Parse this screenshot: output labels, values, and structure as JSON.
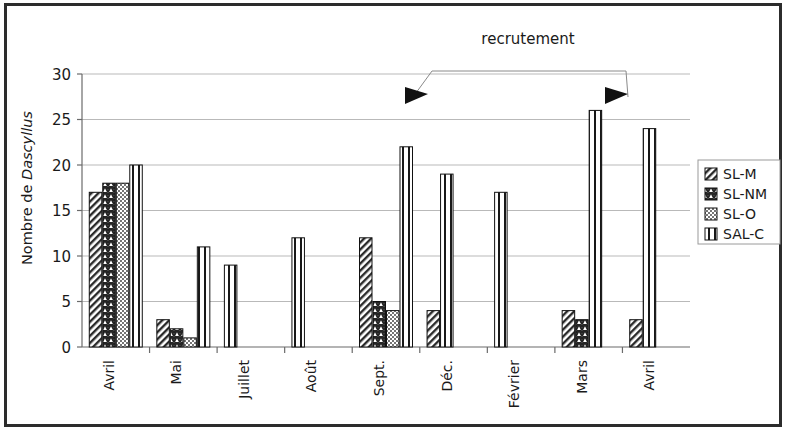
{
  "chart_data": {
    "type": "bar",
    "title": "",
    "xlabel": "",
    "ylabel": "Nombre de Dascyllus",
    "ylabel_plain": "Nombre de ",
    "ylabel_italic": "Dascyllus",
    "ylim": [
      0,
      30
    ],
    "yticks": [
      0,
      5,
      10,
      15,
      20,
      25,
      30
    ],
    "ytick_labels": [
      "0",
      "5",
      "10",
      "15",
      "20",
      "25",
      "30"
    ],
    "grid": true,
    "grid_axis": "y",
    "legend_position": "right",
    "categories": [
      "Avril",
      "Mai",
      "Juillet",
      "Août",
      "Sept.",
      "Déc.",
      "Février",
      "Mars",
      "Avril"
    ],
    "series": [
      {
        "name": "SL-M",
        "pattern": "diagonal-hatch",
        "values": [
          17,
          3,
          0,
          0,
          12,
          4,
          0,
          4,
          3
        ]
      },
      {
        "name": "SL-NM",
        "pattern": "herringbone-dense",
        "values": [
          18,
          2,
          0,
          0,
          5,
          0,
          0,
          3,
          0
        ]
      },
      {
        "name": "SL-O",
        "pattern": "dotted",
        "values": [
          18,
          1,
          0,
          0,
          4,
          0,
          0,
          0,
          0
        ]
      },
      {
        "name": "SAL-C",
        "pattern": "vertical-lines",
        "values": [
          20,
          11,
          9,
          12,
          22,
          19,
          17,
          26,
          24
        ]
      }
    ],
    "annotations": [
      {
        "text": "recrutement",
        "points_to": [
          "Sept.",
          "Mars"
        ]
      }
    ],
    "colors": {
      "bar_outline": "#111111",
      "bar_fill": "#ffffff",
      "grid": "#b9b9b9",
      "axis": "#6b6b6b",
      "text": "#1a1a1a",
      "frame": "#2c2c2c"
    }
  },
  "legend": {
    "items": [
      {
        "label": "SL-M"
      },
      {
        "label": "SL-NM"
      },
      {
        "label": "SL-O"
      },
      {
        "label": "SAL-C"
      }
    ]
  },
  "annotation": {
    "label": "recrutement"
  }
}
